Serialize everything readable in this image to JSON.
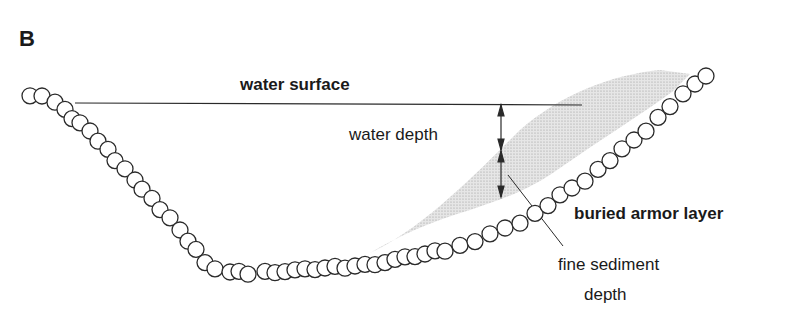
{
  "panel_label": "B",
  "labels": {
    "water_surface": "water surface",
    "water_depth": "water depth",
    "buried_armor_layer": "buried armor layer",
    "fine_sediment_line1": "fine sediment",
    "fine_sediment_line2": "depth"
  },
  "colors": {
    "stroke": "#2a2a2a",
    "sediment_fill": "#cfcfcf",
    "text": "#1a1a1a",
    "background": "#ffffff"
  },
  "diagram": {
    "elements": [
      "armor particle chain",
      "water surface line",
      "water depth double arrow",
      "fine sediment depth double arrow",
      "fine sediment shaded region",
      "leader line to fine sediment label"
    ]
  }
}
